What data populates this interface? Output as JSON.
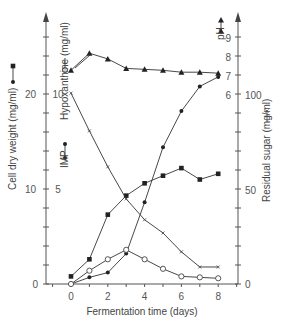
{
  "chart_data": {
    "type": "line",
    "title": "",
    "xlabel": "Fermentation time (days)",
    "x": [
      0,
      1,
      2,
      3,
      4,
      5,
      6,
      7,
      8
    ],
    "x_ticks": [
      "0",
      "2",
      "4",
      "6",
      "8"
    ],
    "xlim": [
      -1.4,
      9
    ],
    "axes": {
      "left_outer": {
        "label": "Cell dry weight (mg/ml)",
        "ticks": [
          "0",
          "10",
          "20"
        ],
        "ylim": [
          0,
          26
        ]
      },
      "left_inner": {
        "label_imp": "IMP",
        "label_hyp": "Hypoxanthine (mg/ml)",
        "ticks": [
          "0",
          "5",
          "10"
        ],
        "ylim": [
          0,
          13
        ]
      },
      "right_outer": {
        "label": "Residual sugar (mg/ml)",
        "ticks": [
          "0",
          "50",
          "100"
        ],
        "ylim": [
          0,
          140
        ]
      },
      "right_inner": {
        "label": "pH",
        "ticks": [
          "6",
          "7",
          "8",
          "9"
        ],
        "ylim": [
          1,
          10
        ]
      }
    },
    "series": [
      {
        "name": "Cell dry weight (mg/ml)",
        "marker": "filled-square",
        "axis": "left_outer",
        "values": [
          0.8,
          2.6,
          7.3,
          9.3,
          10.6,
          11.4,
          12.2,
          11.0,
          11.6
        ]
      },
      {
        "name": "IMP (mg/ml)",
        "marker": "filled-circle",
        "axis": "left_inner",
        "values": [
          0.0,
          0.35,
          0.6,
          1.6,
          4.3,
          7.2,
          9.1,
          10.4,
          10.9
        ]
      },
      {
        "name": "Hypoxanthine (mg/ml)",
        "marker": "open-circle",
        "axis": "left_inner",
        "values": [
          0.0,
          0.7,
          1.3,
          1.8,
          1.3,
          0.8,
          0.4,
          0.35,
          0.3
        ]
      },
      {
        "name": "Residual sugar (mg/ml)",
        "marker": "x",
        "axis": "right_outer",
        "values": [
          101,
          81,
          62,
          45,
          34,
          27,
          17,
          9,
          9
        ]
      },
      {
        "name": "pH",
        "marker": "filled-triangle",
        "axis": "right_inner",
        "values": [
          7.3,
          8.2,
          7.9,
          7.4,
          7.35,
          7.3,
          7.2,
          7.2,
          7.15
        ]
      }
    ],
    "grid": false,
    "legend": "inline axis labels with marker glyphs"
  }
}
